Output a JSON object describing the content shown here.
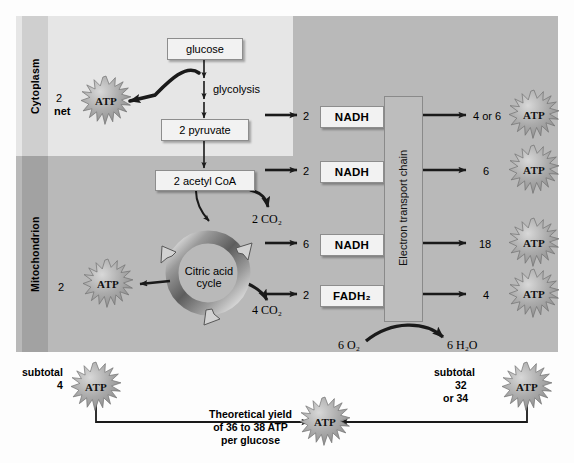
{
  "diagram": {
    "compartments": [
      {
        "name": "cytoplasm-label",
        "label": "Cytoplasm"
      },
      {
        "name": "mitochondrion-label",
        "label": "Mitochondrion"
      }
    ],
    "molecules": {
      "glucose": "glucose",
      "pyruvate": "2 pyruvate",
      "acetyl_coa": "2 acetyl CoA",
      "citric_acid_cycle": "Citric acid\ncycle",
      "citric_line1": "Citric acid",
      "citric_line2": "cycle",
      "electron_transport_chain": "Electron transport chain"
    },
    "pathway_labels": {
      "glycolysis": "glycolysis",
      "co2_from_acetyl": "2 CO₂",
      "co2_from_cycle": "4 CO₂",
      "oxygen": "6 O₂",
      "water": "6 H₂O"
    },
    "glycolysis_atp": {
      "count": "2",
      "qualifier": "net",
      "label": "ATP"
    },
    "cycle_atp": {
      "count": "2",
      "label": "ATP"
    },
    "carrier_rows": [
      {
        "count": "2",
        "carrier": "NADH",
        "atp_yield": "4 or 6",
        "atp_label": "ATP"
      },
      {
        "count": "2",
        "carrier": "NADH",
        "atp_yield": "6",
        "atp_label": "ATP"
      },
      {
        "count": "6",
        "carrier": "NADH",
        "atp_yield": "18",
        "atp_label": "ATP"
      },
      {
        "count": "2",
        "carrier": "FADH₂",
        "atp_yield": "4",
        "atp_label": "ATP"
      }
    ],
    "subtotal_left": {
      "label": "subtotal",
      "value": "4",
      "atp_label": "ATP"
    },
    "subtotal_right": {
      "label": "subtotal",
      "value": "32",
      "value_alt": "or 34",
      "atp_label": "ATP"
    },
    "total": {
      "line1": "Theoretical yield",
      "line2": "of 36 to 38 ATP",
      "line3": "per glucose",
      "atp_label": "ATP"
    },
    "colors": {
      "cytoplasm_bg": "#e6e6e6",
      "mitochondrion_bg": "#b9b9b9",
      "box_bg": "#f2f2f2",
      "arrow": "#1a1a1a",
      "atp_fill": "#a8a8a8"
    }
  }
}
